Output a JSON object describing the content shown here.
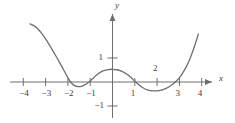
{
  "figure": {
    "axis_label_x": "x",
    "axis_label_y": "y",
    "stroke_color": "#6e6e73",
    "axis_color": "#6e6e73",
    "text_color": "#3c3c3c",
    "background": "#ffffff"
  },
  "ticks": {
    "x": [
      {
        "label": "−4",
        "value": -4,
        "px": 23,
        "side": "below"
      },
      {
        "label": "−3",
        "value": -3,
        "px": 45,
        "side": "below"
      },
      {
        "label": "−2",
        "value": -2,
        "px": 68,
        "side": "below"
      },
      {
        "label": "−1",
        "value": -1,
        "px": 90,
        "side": "below"
      },
      {
        "label": "1",
        "value": 1,
        "px": 135,
        "side": "below"
      },
      {
        "label": "2",
        "value": 2,
        "px": 157,
        "side": "above"
      },
      {
        "label": "3",
        "value": 3,
        "px": 179,
        "side": "below"
      },
      {
        "label": "4",
        "value": 4,
        "px": 201,
        "side": "below"
      }
    ],
    "y": [
      {
        "label": "1",
        "value": 1,
        "px": 58
      },
      {
        "label": "−1",
        "value": -1,
        "px": 106
      }
    ]
  },
  "chart_data": {
    "type": "line",
    "title": "",
    "xlabel": "x",
    "ylabel": "y",
    "grid": false,
    "legend": null,
    "xlim": [
      -4.4,
      4.4
    ],
    "ylim": [
      -1.5,
      2.6
    ],
    "xticks": [
      -4,
      -3,
      -2,
      -1,
      1,
      2,
      3,
      4
    ],
    "yticks": [
      1,
      -1
    ],
    "annotations": [
      {
        "text": "local maximum",
        "x": 0,
        "y": 0.52
      },
      {
        "text": "local minimum",
        "x": -1.5,
        "y": -0.18
      },
      {
        "text": "local minimum",
        "x": 2.1,
        "y": -0.36
      },
      {
        "text": "x-intercept",
        "x": -2.0,
        "y": 0
      },
      {
        "text": "x-intercept",
        "x": -1.05,
        "y": 0
      },
      {
        "text": "x-intercept",
        "x": 1.05,
        "y": 0
      },
      {
        "text": "x-intercept",
        "x": 2.95,
        "y": 0
      }
    ],
    "series": [
      {
        "name": "curve",
        "color": "#6e6e73",
        "x": [
          -3.7,
          -3.55,
          -3.4,
          -3.2,
          -3.0,
          -2.8,
          -2.6,
          -2.4,
          -2.2,
          -2.0,
          -1.85,
          -1.7,
          -1.55,
          -1.4,
          -1.25,
          -1.1,
          -1.0,
          -0.85,
          -0.7,
          -0.55,
          -0.4,
          -0.2,
          0.0,
          0.2,
          0.4,
          0.55,
          0.7,
          0.85,
          1.0,
          1.1,
          1.25,
          1.4,
          1.6,
          1.8,
          2.0,
          2.15,
          2.3,
          2.5,
          2.7,
          2.85,
          3.0,
          3.15,
          3.3,
          3.45,
          3.6,
          3.75,
          3.85
        ],
        "y": [
          2.42,
          2.36,
          2.26,
          2.06,
          1.8,
          1.5,
          1.18,
          0.86,
          0.52,
          0.18,
          -0.04,
          -0.15,
          -0.19,
          -0.18,
          -0.12,
          -0.03,
          0.04,
          0.17,
          0.3,
          0.4,
          0.47,
          0.52,
          0.53,
          0.51,
          0.45,
          0.38,
          0.29,
          0.17,
          0.04,
          -0.05,
          -0.17,
          -0.26,
          -0.34,
          -0.37,
          -0.37,
          -0.35,
          -0.31,
          -0.22,
          -0.09,
          0.03,
          0.18,
          0.38,
          0.62,
          0.92,
          1.28,
          1.7,
          2.0
        ]
      }
    ]
  }
}
